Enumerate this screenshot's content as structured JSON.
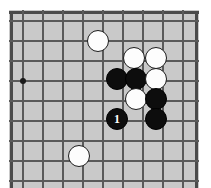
{
  "app": {
    "title": "Go board diagram",
    "type": "go-game-diagram"
  },
  "board": {
    "background_color": "#c9c9c9",
    "line_color": "#5a5a5a",
    "edge_color": "#4a4a4a",
    "grid_spacing_px": 20,
    "origin_x_px": 13,
    "origin_y_px": 10,
    "visible_columns": 9,
    "visible_rows": 9,
    "corner": "left-edge-partial",
    "star_points": [
      {
        "name": "star-point-left",
        "x": 13,
        "y": 70
      }
    ]
  },
  "stones": [
    {
      "id": "white-1",
      "color": "white",
      "label": "",
      "x": 88,
      "y": 30
    },
    {
      "id": "white-2",
      "color": "white",
      "label": "",
      "x": 124,
      "y": 47
    },
    {
      "id": "white-3",
      "color": "white",
      "label": "",
      "x": 146,
      "y": 47
    },
    {
      "id": "black-1",
      "color": "black",
      "label": "",
      "x": 107,
      "y": 68
    },
    {
      "id": "black-2",
      "color": "black",
      "label": "",
      "x": 126,
      "y": 68
    },
    {
      "id": "white-4",
      "color": "white",
      "label": "",
      "x": 146,
      "y": 68
    },
    {
      "id": "white-5",
      "color": "white",
      "label": "",
      "x": 126,
      "y": 88
    },
    {
      "id": "black-3",
      "color": "black",
      "label": "",
      "x": 146,
      "y": 88
    },
    {
      "id": "black-move-1",
      "color": "black",
      "label": "1",
      "x": 107,
      "y": 108
    },
    {
      "id": "black-4",
      "color": "black",
      "label": "",
      "x": 146,
      "y": 108
    },
    {
      "id": "white-6",
      "color": "white",
      "label": "",
      "x": 69,
      "y": 145
    }
  ],
  "grid": {
    "vertical_x": [
      13,
      33,
      53,
      73,
      93,
      113,
      133,
      153,
      173
    ],
    "horizontal_y": [
      10,
      30,
      50,
      70,
      90,
      110,
      130,
      150,
      170
    ]
  },
  "colors": {
    "board": "#c9c9c9",
    "lines": "#5a5a5a",
    "black_stone": "#0d0d0d",
    "white_stone": "#fdfdfd",
    "page": "#ffffff"
  }
}
